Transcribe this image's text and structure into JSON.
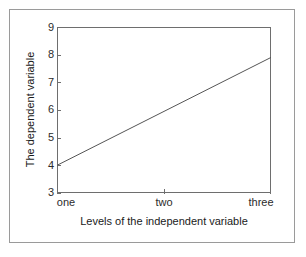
{
  "figure": {
    "background_color": "#ffffff",
    "frame_color": "#9a9a9a",
    "axis_color": "#6e6e6e",
    "line_color": "#555555"
  },
  "chart_data": {
    "type": "line",
    "title": "",
    "subtitle": "",
    "xlabel": "Levels of the independent variable",
    "ylabel": "The dependent variable",
    "categories": [
      "one",
      "two",
      "three"
    ],
    "x_tick_labels": [
      "one",
      "two",
      "three"
    ],
    "y_tick_labels": [
      "3",
      "4",
      "5",
      "6",
      "7",
      "8",
      "9"
    ],
    "ylim": [
      3,
      9
    ],
    "grid": false,
    "legend": false,
    "series": [
      {
        "name": "",
        "values": [
          4.0,
          5.95,
          7.9
        ]
      }
    ]
  }
}
